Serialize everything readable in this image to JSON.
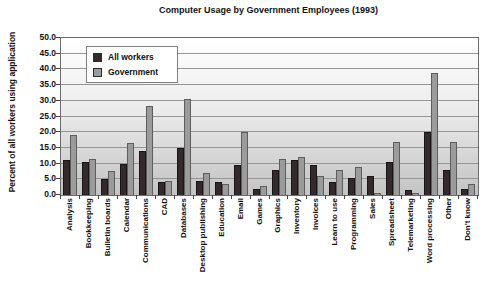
{
  "title": "Computer Usage by Government Employees (1993)",
  "y_axis_title": "Percent of all workers using application",
  "legend": [
    {
      "name": "All workers",
      "color": "#332a2c"
    },
    {
      "name": "Government",
      "color": "#9b9b9b"
    }
  ],
  "chart_data": {
    "type": "bar",
    "title": "Computer Usage by Government Employees (1993)",
    "xlabel": "",
    "ylabel": "Percent of all workers using application",
    "ylim": [
      0,
      50
    ],
    "ytick_step": 5,
    "ytick_format_decimals": 1,
    "grid": "horizontal",
    "legend_position": "top-left-inside",
    "plot_background": "vertical gradient white to gray",
    "categories": [
      "Analysis",
      "Bookkeeping",
      "Bulletin boards",
      "Calendar",
      "Communications",
      "CAD",
      "Databases",
      "Desktop publishing",
      "Education",
      "Email",
      "Games",
      "Graphics",
      "Inventory",
      "Invoices",
      "Learn to use",
      "Programming",
      "Sales",
      "Spreadsheet",
      "Telemarketing",
      "Word processing",
      "Other",
      "Don't know"
    ],
    "series": [
      {
        "name": "All workers",
        "color": "#332a2c",
        "values": [
          11,
          10.5,
          5,
          10,
          14,
          4,
          15,
          4.5,
          4,
          9.5,
          2,
          8,
          11,
          9.5,
          4,
          5.5,
          6,
          10.5,
          1.5,
          20,
          8,
          2
        ]
      },
      {
        "name": "Government",
        "color": "#9b9b9b",
        "values": [
          19,
          11.5,
          7.5,
          16.5,
          28.5,
          4.5,
          30.5,
          7,
          3.5,
          20,
          3,
          11.5,
          12,
          6,
          8,
          9,
          0.5,
          17,
          0.5,
          39,
          17,
          3.5
        ]
      }
    ]
  }
}
